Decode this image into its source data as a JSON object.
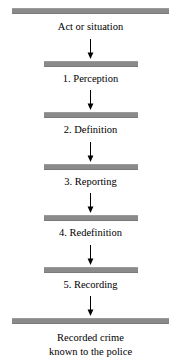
{
  "diagram": {
    "orientation": "vertical",
    "bar_color": "#8a8a8a",
    "arrow_color": "#000000",
    "background_color": "#ffffff",
    "stages": [
      {
        "id": "stage-0",
        "label": "Act or situation",
        "bar": "wide",
        "number": ""
      },
      {
        "id": "stage-1",
        "label": "1. Perception",
        "bar": "narrow",
        "number": "1"
      },
      {
        "id": "stage-2",
        "label": "2. Definition",
        "bar": "narrow",
        "number": "2"
      },
      {
        "id": "stage-3",
        "label": "3. Reporting",
        "bar": "narrow",
        "number": "3"
      },
      {
        "id": "stage-4",
        "label": "4. Redefinition",
        "bar": "narrow",
        "number": "4"
      },
      {
        "id": "stage-5",
        "label": "5. Recording",
        "bar": "narrow",
        "number": "5"
      },
      {
        "id": "stage-6",
        "label": "Recorded crime known to the police",
        "bar": "wide",
        "number": ""
      }
    ],
    "final_label_line1": "Recorded crime",
    "final_label_line2": "known to the police",
    "arrows": [
      {
        "id": "arrow-1",
        "from": "stage-0",
        "to": "stage-1",
        "direction": "down"
      },
      {
        "id": "arrow-2",
        "from": "stage-1",
        "to": "stage-2",
        "direction": "down"
      },
      {
        "id": "arrow-3",
        "from": "stage-2",
        "to": "stage-3",
        "direction": "down"
      },
      {
        "id": "arrow-4",
        "from": "stage-3",
        "to": "stage-4",
        "direction": "down"
      },
      {
        "id": "arrow-5",
        "from": "stage-4",
        "to": "stage-5",
        "direction": "down"
      },
      {
        "id": "arrow-6",
        "from": "stage-5",
        "to": "stage-6",
        "direction": "down"
      }
    ]
  }
}
